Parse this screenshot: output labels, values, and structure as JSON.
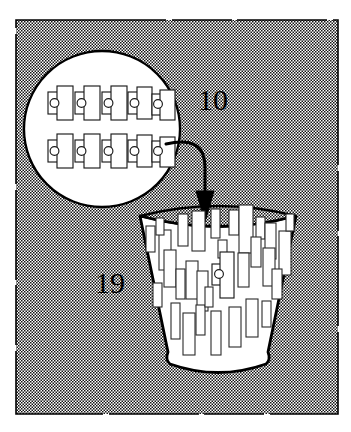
{
  "figure": {
    "type": "patent-line-drawing",
    "title": "",
    "background_fill": "stipple-halftone",
    "colors": {
      "ink": "#000000",
      "paper": "#ffffff",
      "stipple_dot": "#111111",
      "stipple_field": "#ffffff"
    }
  },
  "frame": {
    "name": "drawing-border",
    "x": 16,
    "y": 20,
    "width": 322,
    "height": 394,
    "style": "stippled-panel"
  },
  "reference_numerals": [
    {
      "id": "numeral-10",
      "label": "10",
      "x": 198,
      "y": 99,
      "points_to": "magnified-card-stack",
      "leader": "curve-to-detail-circle"
    },
    {
      "id": "numeral-19",
      "label": "19",
      "x": 110,
      "y": 282,
      "points_to": "collection-bin",
      "leader": "none"
    }
  ],
  "detail_circle": {
    "name": "magnifier-detail-circle",
    "cx": 102,
    "cy": 129,
    "r": 78,
    "fill": "#ffffff",
    "stroke": "#000000",
    "stroke_width": 2.2,
    "contents_label": "card-array",
    "rows": 2,
    "columns": 5,
    "item_count": 10,
    "item_type": "card-with-eyelet",
    "items": [
      {
        "row": 0,
        "col": 0,
        "x": 48,
        "y": 90
      },
      {
        "row": 0,
        "col": 1,
        "x": 74,
        "y": 90
      },
      {
        "row": 0,
        "col": 2,
        "x": 100,
        "y": 90
      },
      {
        "row": 0,
        "col": 3,
        "x": 126,
        "y": 90
      },
      {
        "row": 0,
        "col": 4,
        "x": 150,
        "y": 92
      },
      {
        "row": 1,
        "col": 0,
        "x": 48,
        "y": 137
      },
      {
        "row": 1,
        "col": 1,
        "x": 74,
        "y": 137
      },
      {
        "row": 1,
        "col": 2,
        "x": 100,
        "y": 137
      },
      {
        "row": 1,
        "col": 3,
        "x": 126,
        "y": 137
      },
      {
        "row": 1,
        "col": 4,
        "x": 150,
        "y": 139
      }
    ]
  },
  "arrow": {
    "name": "flow-arrow",
    "description": "curved leader from detail circle down into bin mouth",
    "path": "M 168 143 C 196 140 205 146 205 166 L 205 190",
    "head_tip": [
      205,
      218
    ],
    "head_width": 17,
    "head_height": 26,
    "stroke_width": 3
  },
  "collection_bin": {
    "name": "collection-bin",
    "shape": "tapered-hopper",
    "top_left": [
      140,
      216
    ],
    "top_right": [
      296,
      216
    ],
    "bottom_left": [
      168,
      363
    ],
    "bottom_right": [
      272,
      363
    ],
    "rim_ellipse": {
      "cx": 218,
      "cy": 215,
      "rx": 78,
      "ry": 15
    },
    "stroke_width": 2.6,
    "fill": "#ffffff",
    "contents_label": "loose cards",
    "loose_card_count": 30,
    "cards": [
      {
        "x": 146,
        "y": 226,
        "w": 9,
        "h": 26,
        "r": 0
      },
      {
        "x": 159,
        "y": 228,
        "w": 12,
        "h": 40,
        "r": 0
      },
      {
        "x": 178,
        "y": 216,
        "w": 10,
        "h": 32,
        "r": 0
      },
      {
        "x": 192,
        "y": 213,
        "w": 13,
        "h": 38,
        "r": 0
      },
      {
        "x": 211,
        "y": 210,
        "w": 9,
        "h": 29,
        "r": 0
      },
      {
        "x": 229,
        "y": 211,
        "w": 10,
        "h": 25,
        "r": 0
      },
      {
        "x": 238,
        "y": 207,
        "w": 14,
        "h": 46,
        "r": 0
      },
      {
        "x": 256,
        "y": 218,
        "w": 9,
        "h": 22,
        "r": 0
      },
      {
        "x": 264,
        "y": 222,
        "w": 11,
        "h": 36,
        "r": 0
      },
      {
        "x": 279,
        "y": 230,
        "w": 12,
        "h": 44,
        "r": 0
      },
      {
        "x": 251,
        "y": 236,
        "w": 10,
        "h": 30,
        "r": 0
      },
      {
        "x": 262,
        "y": 246,
        "w": 12,
        "h": 38,
        "r": 0
      },
      {
        "x": 237,
        "y": 252,
        "w": 11,
        "h": 34,
        "r": 0
      },
      {
        "x": 164,
        "y": 250,
        "w": 12,
        "h": 37,
        "r": 0
      },
      {
        "x": 175,
        "y": 268,
        "w": 9,
        "h": 30,
        "r": 0
      },
      {
        "x": 186,
        "y": 260,
        "w": 12,
        "h": 38,
        "r": 0
      },
      {
        "x": 196,
        "y": 270,
        "w": 11,
        "h": 40,
        "r": 0
      },
      {
        "x": 209,
        "y": 265,
        "w": 8,
        "h": 22,
        "r": 0
      },
      {
        "x": 224,
        "y": 268,
        "w": 12,
        "h": 34,
        "r": 0
      },
      {
        "x": 246,
        "y": 298,
        "w": 12,
        "h": 38,
        "r": 0
      },
      {
        "x": 261,
        "y": 300,
        "w": 9,
        "h": 26,
        "r": 0
      },
      {
        "x": 229,
        "y": 306,
        "w": 12,
        "h": 40,
        "r": 0
      },
      {
        "x": 211,
        "y": 310,
        "w": 10,
        "h": 44,
        "r": 0
      },
      {
        "x": 196,
        "y": 304,
        "w": 9,
        "h": 30,
        "r": 0
      },
      {
        "x": 183,
        "y": 312,
        "w": 12,
        "h": 42,
        "r": 0
      },
      {
        "x": 171,
        "y": 302,
        "w": 9,
        "h": 36,
        "r": 0
      },
      {
        "x": 205,
        "y": 286,
        "w": 8,
        "h": 20,
        "r": 0
      },
      {
        "x": 272,
        "y": 268,
        "w": 10,
        "h": 30,
        "r": 0
      },
      {
        "x": 153,
        "y": 282,
        "w": 9,
        "h": 24,
        "r": 0
      },
      {
        "x": 218,
        "y": 240,
        "w": 9,
        "h": 18,
        "r": 0
      }
    ],
    "highlighted_item": {
      "name": "card-with-eyelet-in-bin",
      "x": 215,
      "y": 262,
      "note": "same card-with-eyelet construction as detail circle items"
    }
  }
}
